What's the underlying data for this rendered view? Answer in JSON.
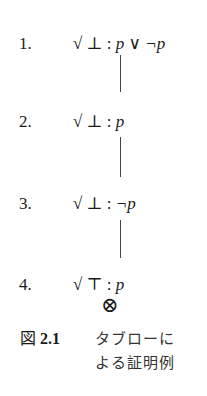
{
  "figure": {
    "rows": [
      {
        "number": "1.",
        "check": "√",
        "sign": "⊥",
        "sep": ":",
        "formula": "p ∨ ¬p"
      },
      {
        "number": "2.",
        "check": "√",
        "sign": "⊥",
        "sep": ":",
        "formula": "p"
      },
      {
        "number": "3.",
        "check": "√",
        "sign": "⊥",
        "sep": ":",
        "formula": "¬p"
      },
      {
        "number": "4.",
        "check": "√",
        "sign": "⊤",
        "sep": ":",
        "formula": "p"
      }
    ],
    "closed_marker": "⊗"
  },
  "caption": {
    "label_prefix": "図",
    "label_number": "2.1",
    "line1": "タブローに",
    "line2": "よる証明例"
  }
}
